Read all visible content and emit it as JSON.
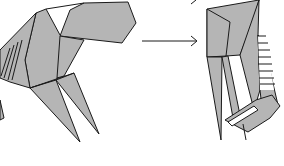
{
  "diagram": {
    "type": "origami-folding-step",
    "steps": [
      {
        "id": "before",
        "description": "folded model, left figure"
      },
      {
        "id": "after",
        "description": "folded model, right figure"
      }
    ],
    "arrow": {
      "direction": "right",
      "meaning": "proceeds to"
    },
    "colors": {
      "paper": "#b5b5b5",
      "line": "#1a1a1a",
      "background": "#ffffff"
    }
  }
}
